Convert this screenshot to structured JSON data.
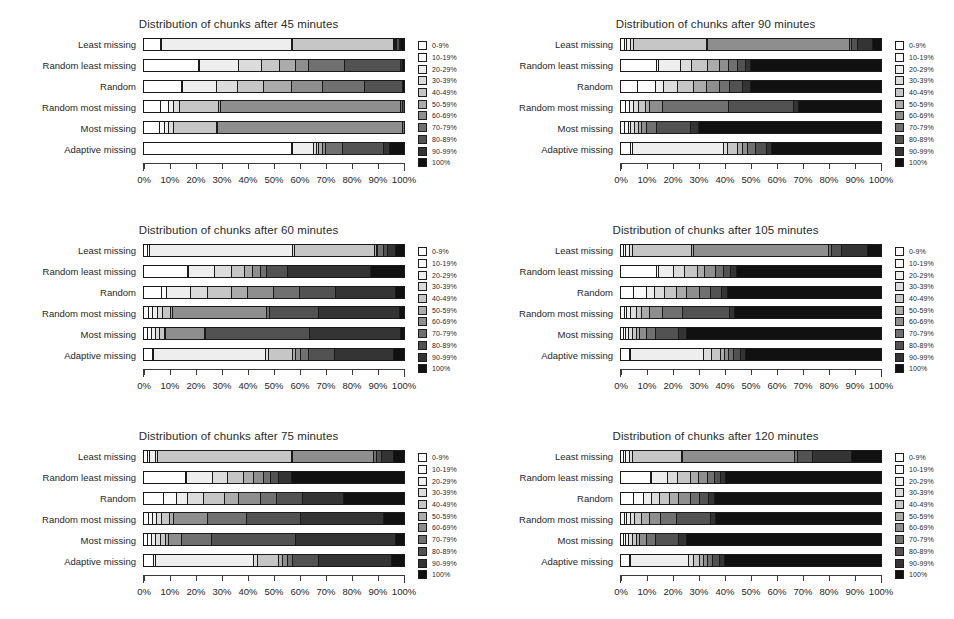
{
  "figure": {
    "row_labels": [
      "Least missing",
      "Random least missing",
      "Random",
      "Random most missing",
      "Most missing",
      "Adaptive missing"
    ],
    "x_ticks": [
      "0%",
      "10%",
      "20%",
      "30%",
      "40%",
      "50%",
      "60%",
      "70%",
      "80%",
      "90%",
      "100%"
    ],
    "legend_labels": [
      "0-9%",
      "10-19%",
      "20-29%",
      "30-39%",
      "40-49%",
      "50-59%",
      "60-69%",
      "70-79%",
      "80-89%",
      "90-99%",
      "100%"
    ],
    "legend_colors": [
      "#ffffff",
      "#fbfbfb",
      "#eeeeee",
      "#dcdcdc",
      "#c6c6c6",
      "#ababab",
      "#8e8e8e",
      "#707070",
      "#525252",
      "#343434",
      "#111111"
    ]
  },
  "chart_data": [
    {
      "type": "bar",
      "title": "Distribution of chunks after 45 minutes",
      "xlabel": "",
      "ylabel": "",
      "xlim": [
        0,
        100
      ],
      "grid": false,
      "legend_position": "right",
      "stacked": true,
      "categories": [
        "Least missing",
        "Random least missing",
        "Random",
        "Random most missing",
        "Most missing",
        "Adaptive missing"
      ],
      "series": [
        {
          "name": "0-9%",
          "values": [
            6.5,
            21.0,
            14.5,
            6.5,
            6.0,
            57.0
          ]
        },
        {
          "name": "10-19%",
          "values": [
            0.5,
            0.5,
            0.5,
            3.0,
            2.0,
            0.5
          ]
        },
        {
          "name": "20-29%",
          "values": [
            50.0,
            15.0,
            13.0,
            2.0,
            1.5,
            8.0
          ]
        },
        {
          "name": "30-39%",
          "values": [
            0.5,
            9.0,
            8.0,
            2.5,
            2.0,
            1.0
          ]
        },
        {
          "name": "40-49%",
          "values": [
            38.5,
            7.0,
            10.0,
            15.0,
            16.5,
            1.0
          ]
        },
        {
          "name": "50-59%",
          "values": [
            0.5,
            6.0,
            11.0,
            0.5,
            0.5,
            1.5
          ]
        },
        {
          "name": "60-69%",
          "values": [
            0.5,
            5.0,
            12.0,
            69.5,
            71.0,
            1.0
          ]
        },
        {
          "name": "70-79%",
          "values": [
            0.5,
            14.0,
            16.0,
            0.5,
            0.5,
            6.5
          ]
        },
        {
          "name": "80-89%",
          "values": [
            1.0,
            21.5,
            14.5,
            0.5,
            0.0,
            16.0
          ]
        },
        {
          "name": "90-99%",
          "values": [
            0.5,
            0.5,
            0.0,
            0.0,
            0.0,
            2.0
          ]
        },
        {
          "name": "100%",
          "values": [
            1.0,
            0.5,
            0.5,
            0.0,
            0.0,
            5.5
          ]
        }
      ]
    },
    {
      "type": "bar",
      "title": "Distribution of chunks after 90 minutes",
      "xlabel": "",
      "ylabel": "",
      "xlim": [
        0,
        100
      ],
      "grid": false,
      "legend_position": "right",
      "stacked": true,
      "categories": [
        "Least missing",
        "Random least missing",
        "Random",
        "Random most missing",
        "Most missing",
        "Adaptive missing"
      ],
      "series": [
        {
          "name": "0-9%",
          "values": [
            1.5,
            14.0,
            6.5,
            2.0,
            1.5,
            4.0
          ]
        },
        {
          "name": "10-19%",
          "values": [
            1.0,
            0.5,
            7.0,
            1.5,
            1.5,
            0.5
          ]
        },
        {
          "name": "20-29%",
          "values": [
            1.5,
            8.5,
            3.0,
            1.5,
            1.0,
            35.0
          ]
        },
        {
          "name": "30-39%",
          "values": [
            1.0,
            4.5,
            5.5,
            2.0,
            1.5,
            1.5
          ]
        },
        {
          "name": "40-49%",
          "values": [
            28.0,
            6.0,
            6.0,
            2.5,
            1.5,
            4.0
          ]
        },
        {
          "name": "50-59%",
          "values": [
            0.5,
            4.5,
            5.0,
            1.5,
            1.0,
            2.0
          ]
        },
        {
          "name": "60-69%",
          "values": [
            54.5,
            3.5,
            5.0,
            5.0,
            2.0,
            2.0
          ]
        },
        {
          "name": "70-79%",
          "values": [
            1.0,
            3.5,
            4.0,
            25.5,
            4.0,
            3.0
          ]
        },
        {
          "name": "80-89%",
          "values": [
            2.0,
            3.0,
            5.0,
            25.0,
            13.0,
            4.0
          ]
        },
        {
          "name": "90-99%",
          "values": [
            6.0,
            2.0,
            3.0,
            2.0,
            3.0,
            2.0
          ]
        },
        {
          "name": "100%",
          "values": [
            3.0,
            50.0,
            50.0,
            31.5,
            70.0,
            42.0
          ]
        }
      ]
    },
    {
      "type": "bar",
      "title": "Distribution of chunks after 60 minutes",
      "xlabel": "",
      "ylabel": "",
      "xlim": [
        0,
        100
      ],
      "grid": false,
      "legend_position": "right",
      "stacked": true,
      "categories": [
        "Least missing",
        "Random least missing",
        "Random",
        "Random most missing",
        "Most missing",
        "Adaptive missing"
      ],
      "series": [
        {
          "name": "0-9%",
          "values": [
            1.5,
            17.0,
            7.0,
            2.0,
            1.5,
            3.5
          ]
        },
        {
          "name": "10-19%",
          "values": [
            1.0,
            0.5,
            2.0,
            1.5,
            1.5,
            0.5
          ]
        },
        {
          "name": "20-29%",
          "values": [
            55.0,
            10.0,
            9.0,
            2.0,
            1.5,
            43.0
          ]
        },
        {
          "name": "30-39%",
          "values": [
            0.5,
            6.5,
            6.5,
            2.0,
            1.5,
            1.0
          ]
        },
        {
          "name": "40-49%",
          "values": [
            31.0,
            5.0,
            9.5,
            3.0,
            2.0,
            9.5
          ]
        },
        {
          "name": "50-59%",
          "values": [
            0.5,
            3.0,
            6.0,
            0.5,
            0.5,
            1.0
          ]
        },
        {
          "name": "60-69%",
          "values": [
            0.5,
            3.0,
            10.0,
            36.5,
            15.0,
            2.0
          ]
        },
        {
          "name": "70-79%",
          "values": [
            2.5,
            2.5,
            10.0,
            1.0,
            0.5,
            3.0
          ]
        },
        {
          "name": "80-89%",
          "values": [
            1.5,
            8.0,
            14.0,
            19.0,
            40.0,
            10.0
          ]
        },
        {
          "name": "90-99%",
          "values": [
            3.0,
            32.0,
            23.0,
            31.0,
            35.0,
            22.5
          ]
        },
        {
          "name": "100%",
          "values": [
            3.0,
            12.5,
            3.0,
            1.5,
            1.0,
            4.0
          ]
        }
      ]
    },
    {
      "type": "bar",
      "title": "Distribution of chunks after 105 minutes",
      "xlabel": "",
      "ylabel": "",
      "xlim": [
        0,
        100
      ],
      "grid": false,
      "legend_position": "right",
      "stacked": true,
      "categories": [
        "Least missing",
        "Random least missing",
        "Random",
        "Random most missing",
        "Most missing",
        "Adaptive missing"
      ],
      "series": [
        {
          "name": "0-9%",
          "values": [
            1.0,
            14.0,
            5.0,
            1.5,
            1.0,
            3.5
          ]
        },
        {
          "name": "10-19%",
          "values": [
            1.0,
            0.5,
            5.0,
            1.0,
            1.0,
            0.5
          ]
        },
        {
          "name": "20-29%",
          "values": [
            1.5,
            6.0,
            3.0,
            1.5,
            1.0,
            28.0
          ]
        },
        {
          "name": "30-39%",
          "values": [
            1.0,
            4.0,
            4.0,
            2.0,
            1.5,
            3.0
          ]
        },
        {
          "name": "40-49%",
          "values": [
            23.0,
            5.0,
            4.5,
            2.0,
            1.5,
            3.5
          ]
        },
        {
          "name": "50-59%",
          "values": [
            0.5,
            3.0,
            4.0,
            3.0,
            1.5,
            1.5
          ]
        },
        {
          "name": "60-69%",
          "values": [
            52.0,
            4.0,
            5.0,
            5.0,
            2.5,
            1.5
          ]
        },
        {
          "name": "70-79%",
          "values": [
            1.0,
            3.0,
            4.0,
            8.0,
            3.5,
            2.0
          ]
        },
        {
          "name": "80-89%",
          "values": [
            4.0,
            3.0,
            4.5,
            18.0,
            9.0,
            2.5
          ]
        },
        {
          "name": "90-99%",
          "values": [
            10.0,
            2.0,
            2.0,
            2.0,
            3.0,
            2.0
          ]
        },
        {
          "name": "100%",
          "values": [
            5.0,
            55.5,
            59.0,
            56.0,
            74.5,
            52.0
          ]
        }
      ]
    },
    {
      "type": "bar",
      "title": "Distribution of chunks after 75 minutes",
      "xlabel": "",
      "ylabel": "",
      "xlim": [
        0,
        100
      ],
      "grid": false,
      "legend_position": "right",
      "stacked": true,
      "categories": [
        "Least missing",
        "Random least missing",
        "Random",
        "Random most missing",
        "Most missing",
        "Adaptive missing"
      ],
      "series": [
        {
          "name": "0-9%",
          "values": [
            1.5,
            16.0,
            7.5,
            2.0,
            1.5,
            4.0
          ]
        },
        {
          "name": "10-19%",
          "values": [
            1.0,
            0.5,
            5.0,
            1.5,
            1.5,
            0.5
          ]
        },
        {
          "name": "20-29%",
          "values": [
            2.0,
            10.0,
            4.5,
            1.5,
            1.5,
            38.0
          ]
        },
        {
          "name": "30-39%",
          "values": [
            1.0,
            6.0,
            6.0,
            2.0,
            2.0,
            1.5
          ]
        },
        {
          "name": "40-49%",
          "values": [
            51.5,
            6.0,
            8.0,
            3.0,
            2.0,
            8.0
          ]
        },
        {
          "name": "50-59%",
          "values": [
            0.5,
            4.0,
            5.5,
            1.5,
            1.0,
            1.5
          ]
        },
        {
          "name": "60-69%",
          "values": [
            31.0,
            3.5,
            8.5,
            13.0,
            5.0,
            2.0
          ]
        },
        {
          "name": "70-79%",
          "values": [
            1.0,
            3.0,
            6.0,
            15.0,
            11.5,
            2.0
          ]
        },
        {
          "name": "80-89%",
          "values": [
            2.0,
            3.0,
            10.0,
            21.0,
            32.5,
            10.0
          ]
        },
        {
          "name": "90-99%",
          "values": [
            4.5,
            5.0,
            16.0,
            32.0,
            38.5,
            28.0
          ]
        },
        {
          "name": "100%",
          "values": [
            4.0,
            43.0,
            23.0,
            7.5,
            3.0,
            4.5
          ]
        }
      ]
    },
    {
      "type": "bar",
      "title": "Distribution of chunks after 120 minutes",
      "xlabel": "",
      "ylabel": "",
      "xlim": [
        0,
        100
      ],
      "grid": false,
      "legend_position": "right",
      "stacked": true,
      "categories": [
        "Least missing",
        "Random least missing",
        "Random",
        "Random most missing",
        "Most missing",
        "Adaptive missing"
      ],
      "series": [
        {
          "name": "0-9%",
          "values": [
            1.0,
            11.5,
            5.0,
            1.5,
            1.0,
            3.5
          ]
        },
        {
          "name": "10-19%",
          "values": [
            1.0,
            0.5,
            4.0,
            1.0,
            1.0,
            0.5
          ]
        },
        {
          "name": "20-29%",
          "values": [
            1.5,
            6.0,
            3.0,
            1.5,
            1.0,
            22.0
          ]
        },
        {
          "name": "30-39%",
          "values": [
            1.0,
            4.0,
            3.0,
            1.5,
            1.5,
            2.0
          ]
        },
        {
          "name": "40-49%",
          "values": [
            19.0,
            5.0,
            4.0,
            2.5,
            1.5,
            2.5
          ]
        },
        {
          "name": "50-59%",
          "values": [
            0.5,
            3.0,
            3.5,
            3.0,
            1.5,
            1.5
          ]
        },
        {
          "name": "60-69%",
          "values": [
            43.0,
            3.5,
            4.5,
            4.5,
            2.5,
            1.5
          ]
        },
        {
          "name": "70-79%",
          "values": [
            1.0,
            2.5,
            3.5,
            6.0,
            3.5,
            2.0
          ]
        },
        {
          "name": "80-89%",
          "values": [
            6.0,
            2.5,
            3.5,
            13.0,
            9.0,
            2.5
          ]
        },
        {
          "name": "90-99%",
          "values": [
            15.0,
            2.0,
            2.0,
            2.0,
            3.0,
            2.0
          ]
        },
        {
          "name": "100%",
          "values": [
            11.0,
            59.5,
            64.0,
            63.5,
            74.5,
            60.0
          ]
        }
      ]
    }
  ]
}
